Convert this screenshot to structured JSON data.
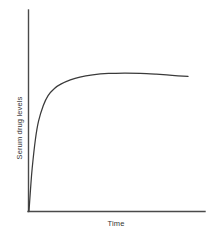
{
  "chart_data": {
    "type": "line",
    "title": "",
    "xlabel": "Time",
    "ylabel": "Serum drug levels",
    "grid": false,
    "legend": null,
    "axes": {
      "x_axis_shown": true,
      "y_axis_shown": true,
      "x_ticks": [],
      "y_ticks": [],
      "xlim": [
        0,
        1
      ],
      "ylim": [
        0,
        1
      ],
      "description": "Unlabeled qualitative axes; no tick marks or numeric scale shown"
    },
    "series": [
      {
        "name": "serum drug concentration",
        "color": "#3a3a3a",
        "description": "Steep exponential rise from origin to a plateau (steady state), followed by a very slight decline toward the right edge",
        "x": [
          0.0,
          0.01,
          0.02,
          0.04,
          0.06,
          0.09,
          0.12,
          0.16,
          0.2,
          0.26,
          0.32,
          0.4,
          0.5,
          0.6,
          0.7,
          0.8,
          0.9,
          1.0
        ],
        "y": [
          0.0,
          0.16,
          0.3,
          0.5,
          0.63,
          0.74,
          0.81,
          0.86,
          0.89,
          0.92,
          0.94,
          0.955,
          0.965,
          0.968,
          0.966,
          0.96,
          0.952,
          0.944
        ]
      }
    ]
  },
  "labels": {
    "y_axis": "Serum drug levels",
    "x_axis": "Time"
  },
  "colors": {
    "curve": "#3a3a3a",
    "axis": "#4a4a4a",
    "text": "#333333",
    "background": "#ffffff"
  }
}
